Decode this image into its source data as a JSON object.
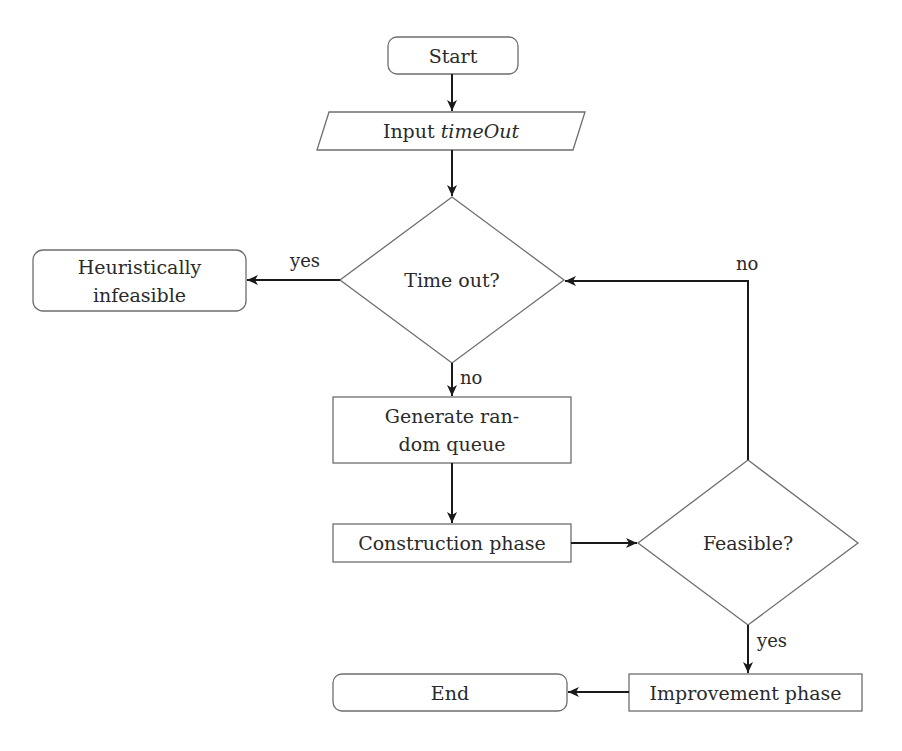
{
  "diagram": {
    "type": "flowchart",
    "nodes": {
      "start": {
        "label": "Start",
        "shape": "rounded-rectangle"
      },
      "input": {
        "label_prefix": "Input",
        "label_var": "timeOut",
        "shape": "parallelogram"
      },
      "timeout": {
        "label": "Time out?",
        "shape": "diamond"
      },
      "infeasible": {
        "line1": "Heuristically",
        "line2": "infeasible",
        "shape": "rounded-rectangle"
      },
      "generate": {
        "line1": "Generate ran-",
        "line2": "dom queue",
        "shape": "rectangle"
      },
      "construction": {
        "label": "Construction phase",
        "shape": "rectangle"
      },
      "feasible": {
        "label": "Feasible?",
        "shape": "diamond"
      },
      "improvement": {
        "label": "Improvement phase",
        "shape": "rectangle"
      },
      "end": {
        "label": "End",
        "shape": "rounded-rectangle"
      }
    },
    "edges": [
      {
        "from": "start",
        "to": "input",
        "label": ""
      },
      {
        "from": "input",
        "to": "timeout",
        "label": ""
      },
      {
        "from": "timeout",
        "to": "infeasible",
        "label": "yes"
      },
      {
        "from": "timeout",
        "to": "generate",
        "label": "no"
      },
      {
        "from": "generate",
        "to": "construction",
        "label": ""
      },
      {
        "from": "construction",
        "to": "feasible",
        "label": ""
      },
      {
        "from": "feasible",
        "to": "timeout",
        "label": "no"
      },
      {
        "from": "feasible",
        "to": "improvement",
        "label": "yes"
      },
      {
        "from": "improvement",
        "to": "end",
        "label": ""
      }
    ],
    "edge_labels": {
      "timeout_yes": "yes",
      "timeout_no": "no",
      "feasible_no": "no",
      "feasible_yes": "yes"
    },
    "colors": {
      "node_border": "#6e6e6e",
      "arrow": "#1a1a1a",
      "text": "#2a2a2a",
      "background": "#ffffff"
    }
  }
}
